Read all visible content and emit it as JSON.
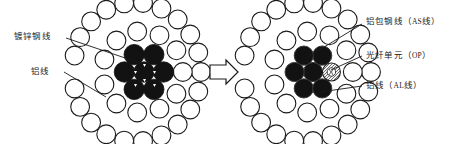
{
  "figure": {
    "background_color": "#ffffff",
    "stroke_color": "#1a1a1a",
    "fill_white": "#ffffff",
    "fill_black": "#121212",
    "fill_hatch": "#e8e8e8"
  },
  "left_cable": {
    "name": "galvanized-steel-core-aluminium-conductor",
    "center_x": 144,
    "center_y": 72,
    "labels": [
      {
        "id": "steel",
        "text": "镀锌钢线",
        "code": "",
        "leader_from_x": 66,
        "leader_from_y": 38,
        "leader_to_x": 138,
        "leader_to_y": 62
      },
      {
        "id": "alum",
        "text": "铝线",
        "code": "",
        "leader_from_x": 64,
        "leader_from_y": 72,
        "leader_to_x": 104,
        "leader_to_y": 97
      }
    ],
    "core": {
      "fill": "black",
      "count": 7,
      "ring_counts": [
        1,
        6
      ]
    },
    "rings": [
      {
        "fill": "white",
        "count": 12
      },
      {
        "fill": "white",
        "count": 18
      }
    ]
  },
  "arrow": {
    "name": "transform-arrow",
    "direction": "right",
    "x": 200,
    "y": 72
  },
  "right_cable": {
    "name": "opgw-aluminium-clad-steel-optical-conductor",
    "center_x": 313,
    "center_y": 72,
    "labels": [
      {
        "id": "as",
        "text": "铝包钢线（",
        "code": "AS",
        "text2": "线）",
        "leader_from_x": 362,
        "leader_from_y": 24,
        "leader_to_x": 306,
        "leader_to_y": 58
      },
      {
        "id": "op",
        "text": "光纤单元（",
        "code": "OP",
        "text2": "）",
        "leader_from_x": 362,
        "leader_from_y": 56,
        "leader_to_x": 327,
        "leader_to_y": 71
      },
      {
        "id": "al",
        "text": "铝线（",
        "code": "AL",
        "text2": "线）",
        "leader_from_x": 362,
        "leader_from_y": 86,
        "leader_to_x": 320,
        "leader_to_y": 92
      }
    ],
    "core": {
      "fill": "black",
      "count": 6,
      "optical_unit_count": 1,
      "optical_unit_position": "right-middle"
    },
    "rings": [
      {
        "fill": "white",
        "count": 12
      },
      {
        "fill": "white",
        "count": 18
      }
    ]
  }
}
